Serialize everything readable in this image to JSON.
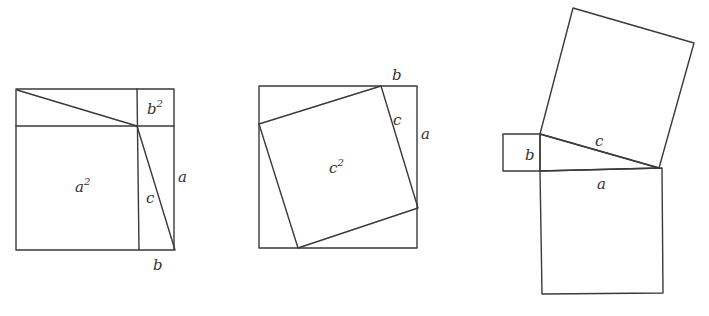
{
  "figures": [
    {
      "id": "rearranged-squares",
      "labels": {
        "a_sq": "a",
        "a_sq_exp": "2",
        "b_sq": "b",
        "b_sq_exp": "2",
        "c": "c",
        "a": "a",
        "b": "b"
      }
    },
    {
      "id": "tilted-square",
      "labels": {
        "c_sq": "c",
        "c_sq_exp": "2",
        "c": "c",
        "a": "a",
        "b": "b"
      }
    },
    {
      "id": "squares-on-sides",
      "labels": {
        "b": "b",
        "c": "c",
        "a": "a"
      }
    }
  ],
  "colors": {
    "line": "#3a3a3a",
    "text": "#333333",
    "background": "#ffffff"
  }
}
